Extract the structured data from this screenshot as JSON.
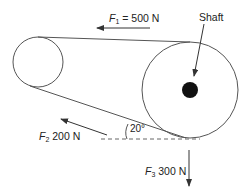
{
  "diagram": {
    "labels": {
      "f1_symbol": "F",
      "f1_sub": "1",
      "f1_value": " = 500 N",
      "shaft": "Shaft",
      "f2_symbol": "F",
      "f2_sub": "2",
      "f2_value": " 200 N",
      "f3_symbol": "F",
      "f3_sub": "3",
      "f3_value": " 300 N",
      "angle": "20°"
    },
    "colors": {
      "stroke": "#555555",
      "shaft_fill": "#111111",
      "text": "#222222"
    }
  }
}
